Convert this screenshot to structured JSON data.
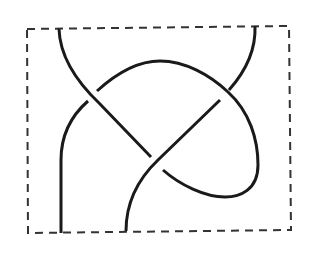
{
  "diagram": {
    "type": "tangle",
    "description": "Knot tangle diagram inside a dashed rectangular box with four endpoints and three crossings",
    "colors": {
      "strand": "#1a1a1a",
      "box": "#333333",
      "background": "#ffffff"
    },
    "box": {
      "style": "dashed",
      "corners": [
        [
          27,
          29
        ],
        [
          289,
          26
        ],
        [
          291,
          230
        ],
        [
          28,
          233
        ]
      ]
    },
    "endpoints": [
      {
        "name": "top-left",
        "x": 59,
        "y": 29
      },
      {
        "name": "top-right",
        "x": 255,
        "y": 26
      },
      {
        "name": "bottom-left",
        "x": 61,
        "y": 233
      },
      {
        "name": "bottom-right",
        "x": 126,
        "y": 231
      }
    ],
    "crossings": [
      {
        "name": "left-crossing",
        "x": 92,
        "y": 96,
        "over": "diagonal strand from top-left"
      },
      {
        "name": "center-crossing",
        "x": 155,
        "y": 163,
        "over": "strand from top-right to bottom"
      },
      {
        "name": "right-crossing",
        "x": 223,
        "y": 95,
        "over": "arch loop"
      }
    ]
  }
}
